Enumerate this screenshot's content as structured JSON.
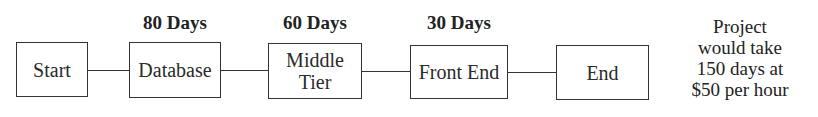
{
  "diagram": {
    "type": "flow",
    "nodes": [
      {
        "id": "start",
        "label": "Start"
      },
      {
        "id": "database",
        "label": "Database",
        "duration": "80 Days"
      },
      {
        "id": "middle-tier",
        "label_lines": [
          "Middle",
          "Tier"
        ],
        "duration": "60 Days"
      },
      {
        "id": "front-end",
        "label": "Front End",
        "duration": "30 Days"
      },
      {
        "id": "end",
        "label": "End"
      }
    ],
    "edges": [
      [
        "start",
        "database"
      ],
      [
        "database",
        "middle-tier"
      ],
      [
        "middle-tier",
        "front-end"
      ],
      [
        "front-end",
        "end"
      ]
    ],
    "note_lines": [
      "Project",
      "would take",
      "150 days at",
      "$50 per hour"
    ]
  }
}
